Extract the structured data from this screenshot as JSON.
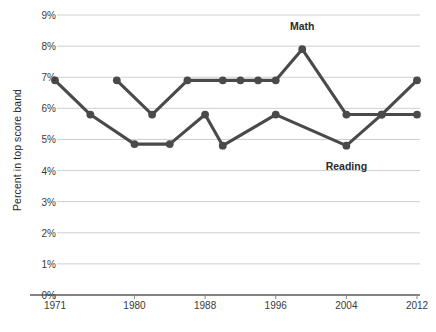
{
  "chart_data": {
    "type": "line",
    "title": "",
    "xlabel": "",
    "ylabel": "Percent in top score band",
    "xlim": [
      1971,
      2012
    ],
    "ylim": [
      0,
      9
    ],
    "ytick_labels": [
      "0%",
      "1%",
      "2%",
      "3%",
      "4%",
      "5%",
      "6%",
      "7%",
      "8%",
      "9%"
    ],
    "ytick_values": [
      0,
      1,
      2,
      3,
      4,
      5,
      6,
      7,
      8,
      9
    ],
    "xtick_labels": [
      "1971",
      "1980",
      "1988",
      "1996",
      "2004",
      "2012"
    ],
    "xtick_values": [
      1971,
      1980,
      1988,
      1996,
      2004,
      2012
    ],
    "grid": true,
    "legend_position": "inline-annotations",
    "annotations": [
      {
        "text": "Math",
        "x": 1999,
        "y": 8.6
      },
      {
        "text": "Reading",
        "x": 2004,
        "y": 4.1
      }
    ],
    "series": [
      {
        "name": "Math",
        "color": "#4a4a4a",
        "points": [
          {
            "x": 1978,
            "y": 6.9
          },
          {
            "x": 1982,
            "y": 5.8
          },
          {
            "x": 1986,
            "y": 6.9
          },
          {
            "x": 1990,
            "y": 6.9
          },
          {
            "x": 1992,
            "y": 6.9
          },
          {
            "x": 1994,
            "y": 6.9
          },
          {
            "x": 1996,
            "y": 6.9
          },
          {
            "x": 1999,
            "y": 7.9
          },
          {
            "x": 2004,
            "y": 5.8
          },
          {
            "x": 2008,
            "y": 5.8
          },
          {
            "x": 2012,
            "y": 6.9
          }
        ]
      },
      {
        "name": "Reading",
        "color": "#4a4a4a",
        "points": [
          {
            "x": 1971,
            "y": 6.9
          },
          {
            "x": 1975,
            "y": 5.8
          },
          {
            "x": 1980,
            "y": 4.85
          },
          {
            "x": 1984,
            "y": 4.85
          },
          {
            "x": 1988,
            "y": 5.8
          },
          {
            "x": 1990,
            "y": 4.8
          },
          {
            "x": 1996,
            "y": 5.8
          },
          {
            "x": 2004,
            "y": 4.8
          },
          {
            "x": 2008,
            "y": 5.8
          },
          {
            "x": 2012,
            "y": 5.8
          }
        ]
      }
    ]
  },
  "axis": {
    "y_title": "Percent in top score band"
  }
}
